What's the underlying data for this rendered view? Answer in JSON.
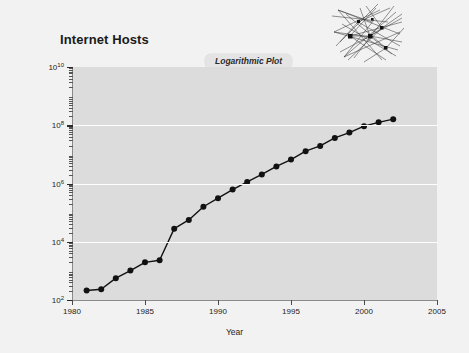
{
  "chart_data": {
    "type": "line",
    "title": "Internet Hosts",
    "badge": "Logarithmic Plot",
    "xlabel": "Year",
    "ylabel": "Internet Hosts",
    "xlim": [
      1980,
      2005
    ],
    "ylim": [
      100,
      10000000000
    ],
    "yscale": "log",
    "grid": true,
    "legend": "none",
    "xticks": [
      "1980",
      "1985",
      "1990",
      "1995",
      "2000",
      "2005"
    ],
    "xtick_values": [
      1980,
      1985,
      1990,
      1995,
      2000,
      2005
    ],
    "yticks": [
      "10²",
      "10⁴",
      "10⁶",
      "10⁸",
      "10¹⁰"
    ],
    "ytick_bases": [
      "10",
      "10",
      "10",
      "10",
      "10"
    ],
    "ytick_exponents": [
      "2",
      "4",
      "6",
      "8",
      "10"
    ],
    "ytick_values": [
      100,
      10000,
      1000000,
      100000000,
      10000000000
    ],
    "series": [
      {
        "name": "Internet Hosts",
        "marker": "filled-circle",
        "color": "#111111",
        "x": [
          1981,
          1982,
          1983,
          1984,
          1985,
          1986,
          1987,
          1988,
          1989,
          1990,
          1991,
          1992,
          1993,
          1994,
          1995,
          1996,
          1997,
          1998,
          1999,
          2000,
          2001,
          2002
        ],
        "values": [
          213,
          235,
          562,
          1024,
          1961,
          2308,
          28174,
          56000,
          159000,
          313000,
          617000,
          1136000,
          2056000,
          3864000,
          6642000,
          12881000,
          19540000,
          36739000,
          56218000,
          93047000,
          125888000,
          162128000
        ]
      }
    ]
  },
  "decoration": {
    "network_icon_name": "network-mesh-graphic"
  }
}
